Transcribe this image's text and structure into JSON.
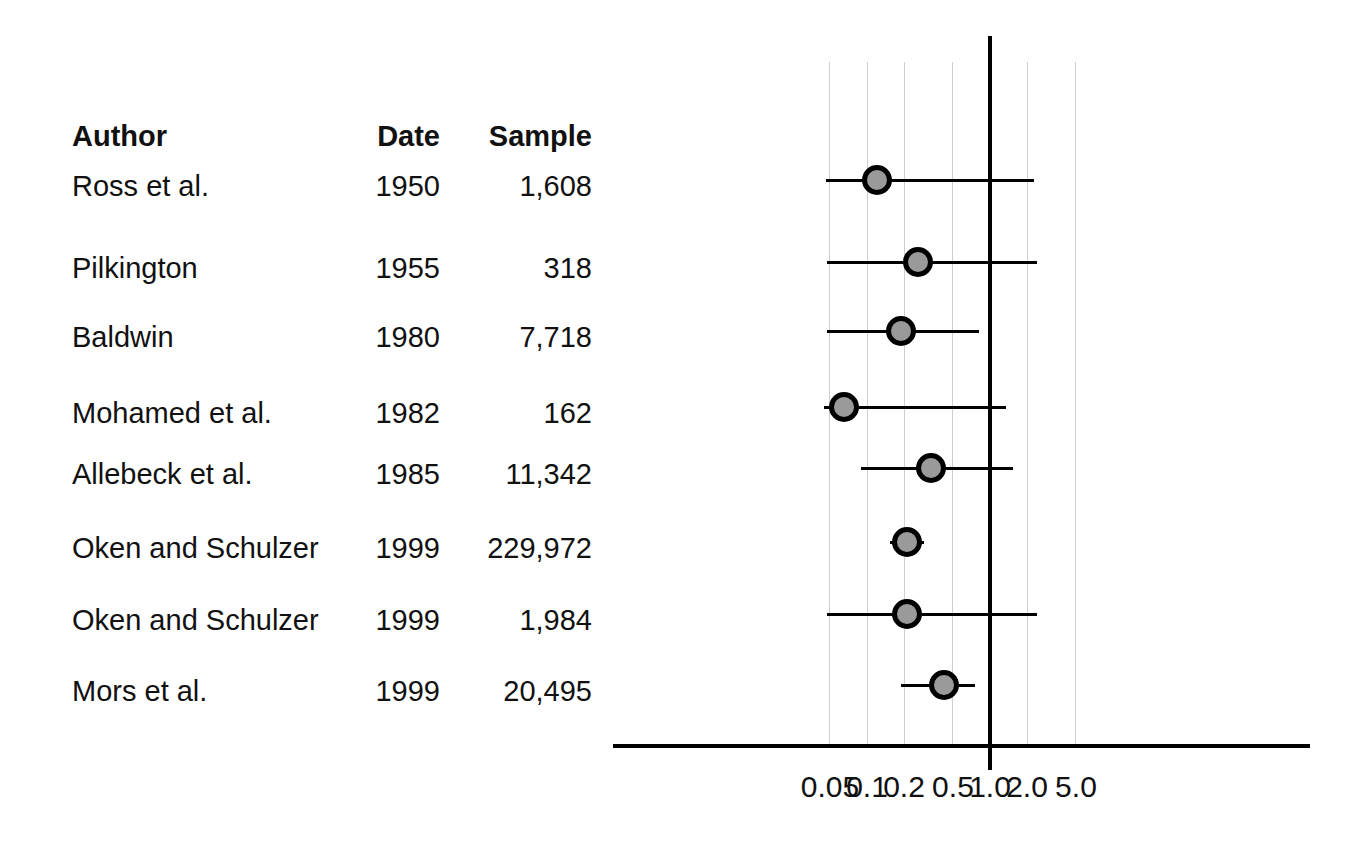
{
  "table": {
    "headers": {
      "author": "Author",
      "date": "Date",
      "sample": "Sample"
    },
    "rows": [
      {
        "author": "Ross et al.",
        "date": "1950",
        "sample": "1,608"
      },
      {
        "author": "Pilkington",
        "date": "1955",
        "sample": "318"
      },
      {
        "author": "Baldwin",
        "date": "1980",
        "sample": "7,718"
      },
      {
        "author": "Mohamed et al.",
        "date": "1982",
        "sample": "162"
      },
      {
        "author": "Allebeck et al.",
        "date": "1985",
        "sample": "11,342"
      },
      {
        "author": "Oken and Schulzer",
        "date": "1999",
        "sample": "229,972"
      },
      {
        "author": "Oken and Schulzer",
        "date": "1999",
        "sample": "1,984"
      },
      {
        "author": "Mors et al.",
        "date": "1999",
        "sample": "20,495"
      }
    ]
  },
  "chart_data": {
    "type": "scatter",
    "subtype": "forest-plot",
    "title": "",
    "xlabel": "",
    "ylabel": "",
    "xscale": "log",
    "xlim": [
      0.04,
      7.0
    ],
    "grid": true,
    "legend": null,
    "reference_line": 1.0,
    "tick_labels": [
      "0.05",
      "0.1",
      "0.2",
      "0.5",
      "1.0",
      "2.0",
      "5.0"
    ],
    "tick_values": [
      0.05,
      0.1,
      0.2,
      0.5,
      1.0,
      2.0,
      5.0
    ],
    "categories": [
      "Ross et al.",
      "Pilkington",
      "Baldwin",
      "Mohamed et al.",
      "Allebeck et al.",
      "Oken and Schulzer",
      "Oken and Schulzer",
      "Mors et al."
    ],
    "points": [
      {
        "label": "Ross et al.",
        "year": 1950,
        "sample": 1608,
        "estimate": 0.12,
        "ci_low": 0.046,
        "ci_high": 2.3
      },
      {
        "label": "Pilkington",
        "year": 1955,
        "sample": 318,
        "estimate": 0.26,
        "ci_low": 0.047,
        "ci_high": 2.4
      },
      {
        "label": "Baldwin",
        "year": 1980,
        "sample": 7718,
        "estimate": 0.19,
        "ci_low": 0.047,
        "ci_high": 0.82
      },
      {
        "label": "Mohamed et al.",
        "year": 1982,
        "sample": 162,
        "estimate": 0.065,
        "ci_low": 0.045,
        "ci_high": 1.35
      },
      {
        "label": "Allebeck et al.",
        "year": 1985,
        "sample": 11342,
        "estimate": 0.33,
        "ci_low": 0.09,
        "ci_high": 1.55
      },
      {
        "label": "Oken and Schulzer",
        "year": 1999,
        "sample": 229972,
        "estimate": 0.21,
        "ci_low": 0.155,
        "ci_high": 0.29
      },
      {
        "label": "Oken and Schulzer",
        "year": 1999,
        "sample": 1984,
        "estimate": 0.21,
        "ci_low": 0.047,
        "ci_high": 2.4
      },
      {
        "label": "Mors et al.",
        "year": 1999,
        "sample": 20495,
        "estimate": 0.42,
        "ci_low": 0.19,
        "ci_high": 0.76
      }
    ],
    "marker_style": {
      "fill": "#9a9a9a",
      "edge": "#000000",
      "shape": "circle"
    }
  }
}
